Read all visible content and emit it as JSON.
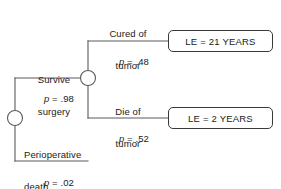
{
  "diagram": {
    "type": "decision-tree",
    "line_color": "#5a5a5a",
    "text_color": "#1a1a1a",
    "background": "#ffffff",
    "nodes": [
      {
        "id": "root",
        "kind": "chance-node",
        "shape": "circle",
        "cx": 15,
        "cy": 118,
        "r": 7.5
      },
      {
        "id": "survive",
        "kind": "chance-node",
        "shape": "circle",
        "cx": 88,
        "cy": 78,
        "r": 7.5
      }
    ],
    "branches": [
      {
        "id": "survive-surgery",
        "label_line1": "Survive",
        "label_line2": "surgery",
        "probability": "p = .98",
        "p_value": 0.98
      },
      {
        "id": "perioperative-death",
        "label_line1": "Perioperative",
        "label_line2": "death",
        "probability": "p = .02",
        "p_value": 0.02
      },
      {
        "id": "cured-of-tumor",
        "label_line1": "Cured of",
        "label_line2": "tumor",
        "probability": "p = .48",
        "p_value": 0.48
      },
      {
        "id": "die-of-tumor",
        "label_line1": "Die of",
        "label_line2": "tumor",
        "probability": "p = .52",
        "p_value": 0.52
      }
    ],
    "outcomes": [
      {
        "id": "le-21-years",
        "text": "LE = 21 YEARS",
        "value": 21,
        "unit": "YEARS"
      },
      {
        "id": "le-2-years",
        "text": "LE = 2 YEARS",
        "value": 2,
        "unit": "YEARS"
      }
    ],
    "probability_prefix": "p",
    "caption_fragment": ""
  }
}
